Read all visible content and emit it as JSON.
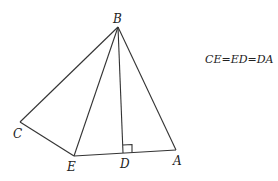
{
  "diagram": {
    "points": [
      {
        "name": "B",
        "label": "B"
      },
      {
        "name": "C",
        "label": "C"
      },
      {
        "name": "E",
        "label": "E"
      },
      {
        "name": "D",
        "label": "D"
      },
      {
        "name": "A",
        "label": "A"
      }
    ],
    "segments": [
      "BC",
      "CE",
      "EA",
      "BE",
      "BD",
      "BA"
    ],
    "right_angle_at": "D",
    "given": "CE=ED=DA"
  }
}
